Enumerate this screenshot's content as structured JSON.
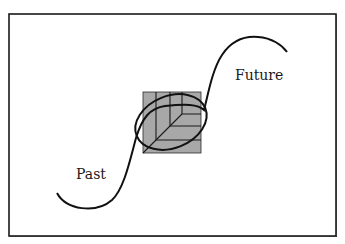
{
  "diagram": {
    "type": "concept-diagram",
    "labels": {
      "future": "Future",
      "past": "Past"
    },
    "colors": {
      "background": "#ffffff",
      "frame": "#1a1a1a",
      "curve": "#111111",
      "square_fill": "#a8a8a8",
      "lines": "#1a1a1a"
    },
    "icons": {
      "center_emblem": "leaf-on-square-icon"
    }
  }
}
